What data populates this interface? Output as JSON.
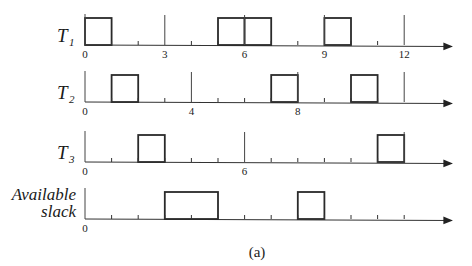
{
  "figure": {
    "caption": "(a)",
    "colors": {
      "ink": "#2a2a2a",
      "background": "#ffffff"
    },
    "axis": {
      "x_origin_px": 85,
      "unit_px": 26.6,
      "x_end_px": 452,
      "max_time": 13
    },
    "rows": [
      {
        "id": "T1",
        "label": "T",
        "subscript": "1",
        "axis_y": 45,
        "period": 3,
        "major_marks": [
          0,
          3,
          6,
          9,
          12
        ],
        "tick_labels": [
          {
            "t": 0,
            "text": "0"
          },
          {
            "t": 3,
            "text": "3"
          },
          {
            "t": 6,
            "text": "6"
          },
          {
            "t": 9,
            "text": "9"
          },
          {
            "t": 12,
            "text": "12"
          }
        ],
        "boxes": [
          {
            "start": 0,
            "end": 1
          },
          {
            "start": 5,
            "end": 6
          },
          {
            "start": 6,
            "end": 7
          },
          {
            "start": 9,
            "end": 10
          }
        ]
      },
      {
        "id": "T2",
        "label": "T",
        "subscript": "2",
        "axis_y": 102,
        "period": 4,
        "major_marks": [
          0,
          4,
          8,
          12
        ],
        "tick_labels": [
          {
            "t": 0,
            "text": "0"
          },
          {
            "t": 4,
            "text": "4"
          },
          {
            "t": 8,
            "text": "8"
          }
        ],
        "boxes": [
          {
            "start": 1,
            "end": 2
          },
          {
            "start": 7,
            "end": 8
          },
          {
            "start": 10,
            "end": 11
          }
        ]
      },
      {
        "id": "T3",
        "label": "T",
        "subscript": "3",
        "axis_y": 162,
        "period": 6,
        "major_marks": [
          0,
          6,
          12
        ],
        "tick_labels": [
          {
            "t": 0,
            "text": "0"
          },
          {
            "t": 6,
            "text": "6"
          }
        ],
        "boxes": [
          {
            "start": 2,
            "end": 3
          },
          {
            "start": 11,
            "end": 12
          }
        ]
      },
      {
        "id": "slack",
        "label_lines": [
          "Available",
          "slack"
        ],
        "axis_y": 219,
        "major_marks": [
          0
        ],
        "tick_labels": [
          {
            "t": 0,
            "text": "0"
          }
        ],
        "boxes": [
          {
            "start": 3,
            "end": 5
          },
          {
            "start": 8,
            "end": 9
          }
        ]
      }
    ]
  }
}
